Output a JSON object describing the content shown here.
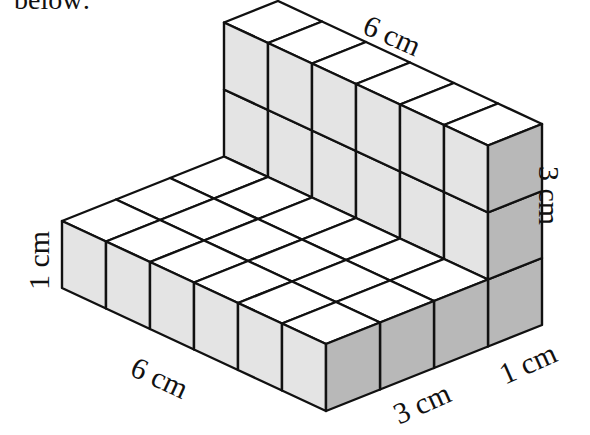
{
  "caption_fragment": "below:",
  "figure": {
    "unit": "cm",
    "floor": {
      "length": 6,
      "depth": 3,
      "height": 1
    },
    "wall": {
      "length": 6,
      "depth": 1,
      "height": 3
    },
    "colors": {
      "top_face": "#ffffff",
      "front_face": "#e4e4e4",
      "side_face": "#b8b8b8",
      "stroke": "#111111"
    }
  },
  "labels": {
    "wall_length": "6 cm",
    "wall_height": "3 cm",
    "floor_height": "1 cm",
    "floor_length": "6 cm",
    "floor_depth": "3 cm",
    "wall_depth": "1 cm"
  }
}
